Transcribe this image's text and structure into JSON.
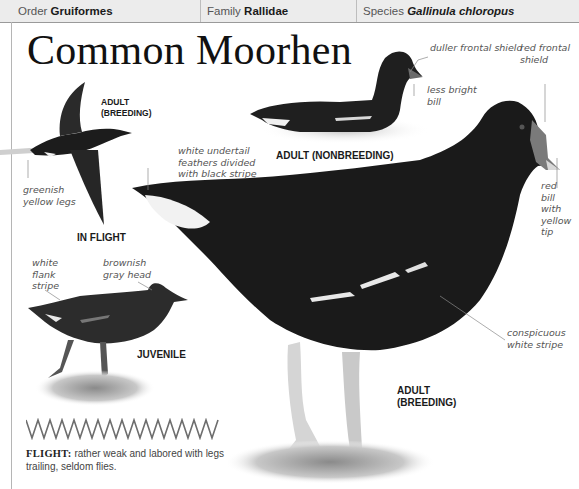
{
  "header": {
    "order_label": "Order",
    "order_value": "Gruiformes",
    "family_label": "Family",
    "family_value": "Rallidae",
    "species_label": "Species",
    "species_value": "Gallinula chloropus"
  },
  "title": "Common Moorhen",
  "figures": {
    "in_flight": {
      "label": "IN FLIGHT",
      "sublabel_line1": "ADULT",
      "sublabel_line2": "(BREEDING)",
      "annotations": [
        {
          "line1": "greenish",
          "line2": "yellow legs"
        }
      ]
    },
    "adult_nonbreeding": {
      "label": "ADULT (NONBREEDING)",
      "annotations": [
        {
          "text": "duller frontal shield"
        },
        {
          "line1": "less bright",
          "line2": "bill"
        }
      ]
    },
    "adult_breeding": {
      "label_line1": "ADULT",
      "label_line2": "(BREEDING)",
      "annotations": [
        {
          "line1": "white undertail",
          "line2": "feathers divided",
          "line3": "with black stripe"
        },
        {
          "line1": "red frontal",
          "line2": "shield"
        },
        {
          "line1": "red",
          "line2": "bill",
          "line3": "with",
          "line4": "yellow",
          "line5": "tip"
        },
        {
          "line1": "conspicuous",
          "line2": "white stripe"
        }
      ]
    },
    "juvenile": {
      "label": "JUVENILE",
      "annotations": [
        {
          "line1": "white",
          "line2": "flank",
          "line3": "stripe"
        },
        {
          "line1": "brownish",
          "line2": "gray head"
        }
      ]
    }
  },
  "flight_note": {
    "label": "FLIGHT:",
    "text": " rather weak and labored with legs trailing, seldom flies."
  },
  "colors": {
    "bird_body": "#1c1c1c",
    "header_bg": "#ececec",
    "annotation_text": "#555555"
  }
}
